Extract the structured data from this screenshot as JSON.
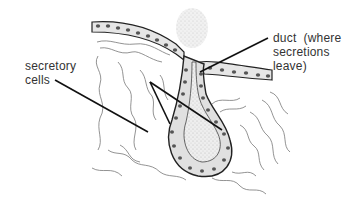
{
  "diagram": {
    "type": "anatomical-illustration",
    "labels": {
      "secretory_cells": {
        "line1": "secretory",
        "line2": "cells"
      },
      "duct": {
        "line1": "duct  (where",
        "line2": "secretions",
        "line3": "leave)"
      }
    },
    "colors": {
      "background": "#ffffff",
      "outline": "#222222",
      "cell_fill": "#e6e6e6",
      "nucleus": "#555555",
      "lumen": "#dcdcdc",
      "text": "#333333",
      "tissue_lines": "#666666"
    }
  }
}
